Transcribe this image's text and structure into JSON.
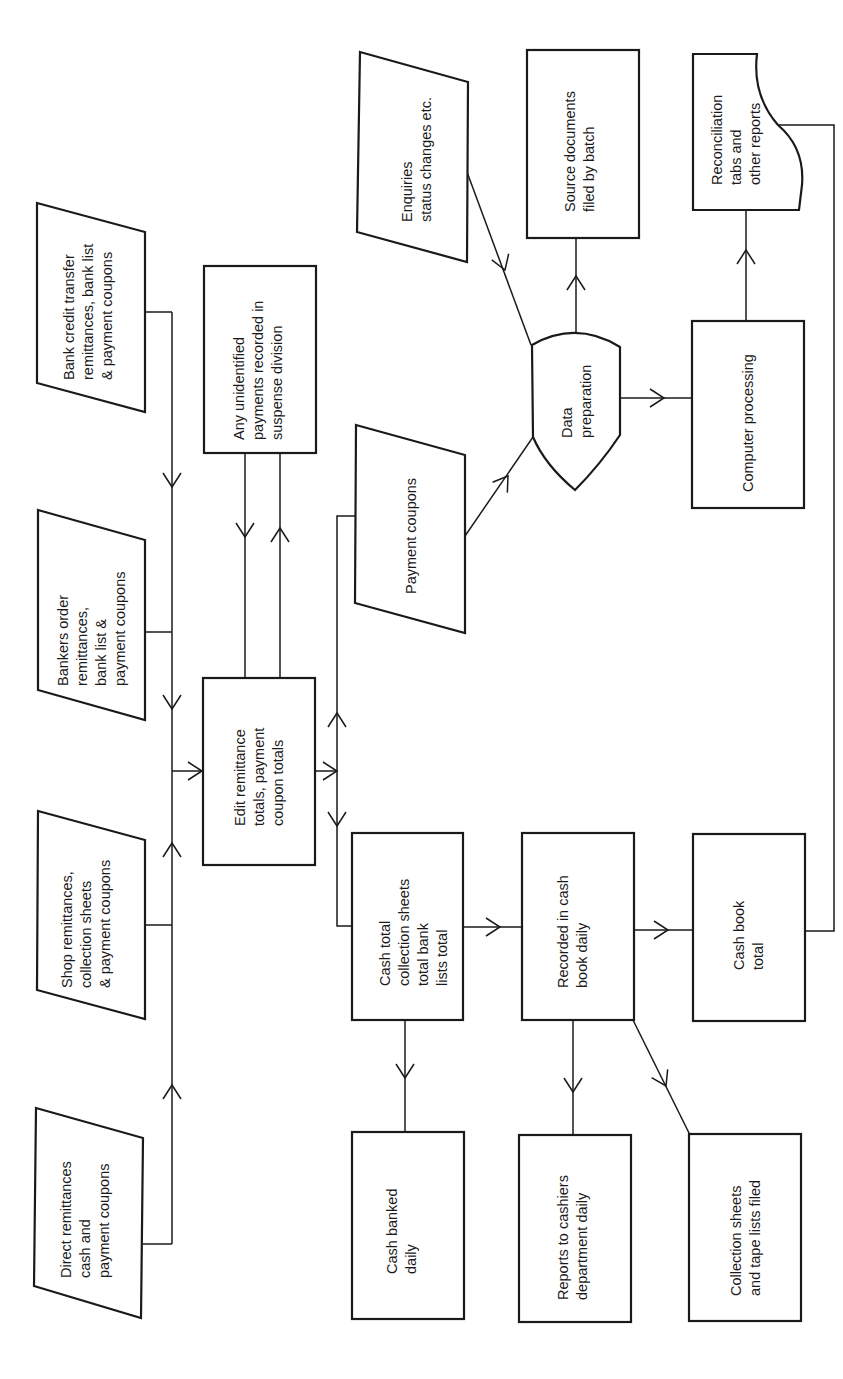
{
  "diagram": {
    "orientation": "rotated-90-ccw",
    "colors": {
      "stroke": "#1a1a1a",
      "background": "#ffffff"
    },
    "nodes": {
      "bank_credit": {
        "shape": "input-parallelogram",
        "lines": [
          "Bank credit transfer",
          "remittances, bank list",
          "& payment coupons"
        ]
      },
      "bankers_order": {
        "shape": "input-parallelogram",
        "lines": [
          "Bankers order",
          "remittances,",
          "bank list &",
          "payment coupons"
        ]
      },
      "shop": {
        "shape": "input-parallelogram",
        "lines": [
          "Shop remittances,",
          "collection sheets",
          "& payment coupons"
        ]
      },
      "direct": {
        "shape": "input-parallelogram",
        "lines": [
          "Direct remittances",
          "cash and",
          "payment coupons"
        ]
      },
      "suspense": {
        "shape": "process",
        "lines": [
          "Any unidentified",
          "payments recorded in",
          "suspense division"
        ]
      },
      "edit": {
        "shape": "process",
        "lines": [
          "Edit remittance",
          "totals, payment",
          "coupon totals"
        ]
      },
      "payment_coupons": {
        "shape": "input-parallelogram",
        "lines": [
          "Payment coupons"
        ]
      },
      "cash_total": {
        "shape": "process",
        "lines": [
          "Cash total",
          "collection sheets",
          "total bank",
          "lists total"
        ]
      },
      "cash_banked": {
        "shape": "process",
        "lines": [
          "Cash banked",
          "daily"
        ]
      },
      "recorded": {
        "shape": "process",
        "lines": [
          "Recorded in cash",
          "book daily"
        ]
      },
      "reports_cashiers": {
        "shape": "process",
        "lines": [
          "Reports to cashiers",
          "department daily"
        ]
      },
      "cash_book_total": {
        "shape": "process",
        "lines": [
          "Cash book",
          "total"
        ]
      },
      "collection_filed": {
        "shape": "process",
        "lines": [
          "Collection sheets",
          "and tape lists filed"
        ]
      },
      "enquiries": {
        "shape": "input-parallelogram",
        "lines": [
          "Enquiries",
          "status changes etc."
        ]
      },
      "source_docs": {
        "shape": "process",
        "lines": [
          "Source documents",
          "filed by batch"
        ]
      },
      "data_prep": {
        "shape": "offline-operation",
        "lines": [
          "Data",
          "preparation"
        ]
      },
      "computer": {
        "shape": "process",
        "lines": [
          "Computer processing"
        ]
      },
      "reconciliation": {
        "shape": "document",
        "lines": [
          "Reconciliation",
          "tabs and",
          "other reports"
        ]
      }
    },
    "edges": [
      {
        "from": "bank_credit",
        "to": "edit"
      },
      {
        "from": "bankers_order",
        "to": "edit"
      },
      {
        "from": "shop",
        "to": "edit"
      },
      {
        "from": "direct",
        "to": "edit"
      },
      {
        "from": "edit",
        "to": "suspense"
      },
      {
        "from": "suspense",
        "to": "edit"
      },
      {
        "from": "edit",
        "to": "payment_coupons"
      },
      {
        "from": "edit",
        "to": "cash_total"
      },
      {
        "from": "payment_coupons",
        "to": "data_prep"
      },
      {
        "from": "enquiries",
        "to": "data_prep"
      },
      {
        "from": "data_prep",
        "to": "source_docs"
      },
      {
        "from": "data_prep",
        "to": "computer"
      },
      {
        "from": "computer",
        "to": "reconciliation"
      },
      {
        "from": "cash_total",
        "to": "recorded"
      },
      {
        "from": "cash_total",
        "to": "cash_banked"
      },
      {
        "from": "recorded",
        "to": "cash_book_total"
      },
      {
        "from": "recorded",
        "to": "reports_cashiers"
      },
      {
        "from": "recorded",
        "to": "collection_filed"
      },
      {
        "from": "cash_book_total",
        "to": "reconciliation"
      }
    ]
  }
}
